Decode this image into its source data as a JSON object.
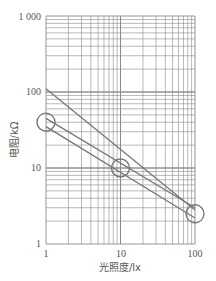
{
  "chart_data": {
    "type": "line",
    "title": "",
    "xlabel": "光照度/lx",
    "ylabel": "电阻/kΩ",
    "xscale": "log",
    "yscale": "log",
    "xlim": [
      1,
      100
    ],
    "ylim": [
      1,
      1000
    ],
    "x_ticks": [
      "1",
      "10",
      "100"
    ],
    "y_ticks": [
      "1",
      "10",
      "100",
      "1 000"
    ],
    "grid": true,
    "legend": null,
    "series": [
      {
        "name": "upper-limit",
        "x": [
          1,
          100
        ],
        "y": [
          110,
          2.8
        ]
      },
      {
        "name": "band-upper",
        "x": [
          1,
          100
        ],
        "y": [
          45,
          3.0
        ]
      },
      {
        "name": "band-lower",
        "x": [
          1,
          100
        ],
        "y": [
          35,
          2.2
        ]
      }
    ],
    "annotations": [
      {
        "type": "circle",
        "x": 1,
        "y": 40
      },
      {
        "type": "circle",
        "x": 10,
        "y": 10
      },
      {
        "type": "circle",
        "x": 100,
        "y": 2.5
      }
    ],
    "colors": {
      "line": "#777777",
      "grid": "#8a8a8a",
      "text": "#555555"
    }
  }
}
